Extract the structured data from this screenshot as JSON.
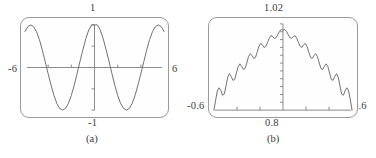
{
  "figure": {
    "background": "#ffffff",
    "frame_color": "#9a9a9a",
    "curve_color": "#6f6f6f",
    "axis_color": "#8a8a8a",
    "text_color": "#3a3a3a"
  },
  "panels": [
    {
      "id": "a",
      "caption": "(a)",
      "labels": {
        "top": "1",
        "left": "-6",
        "right": "6",
        "bottom": "-1"
      }
    },
    {
      "id": "b",
      "caption": "(b)",
      "labels": {
        "top": "1.02",
        "left": "-0.6",
        "right": "0.6",
        "bottom": "0.8"
      }
    }
  ],
  "chart_data": [
    {
      "type": "line",
      "title": "",
      "panel": "a",
      "xlabel": "",
      "ylabel": "",
      "xlim": [
        -6,
        6
      ],
      "ylim": [
        -1,
        1
      ],
      "xticks": [
        -6,
        -4,
        -2,
        0,
        2,
        4,
        6
      ],
      "yticks": [
        -1,
        -0.5,
        0,
        0.5,
        1
      ],
      "grid": false,
      "legend": "none",
      "series": [
        {
          "name": "cos(2x)",
          "expression": "y = cos(2x)",
          "x": [
            -6.0,
            -5.75,
            -5.5,
            -5.25,
            -5.0,
            -4.75,
            -4.5,
            -4.25,
            -4.0,
            -3.75,
            -3.5,
            -3.25,
            -3.0,
            -2.75,
            -2.5,
            -2.25,
            -2.0,
            -1.75,
            -1.5,
            -1.25,
            -1.0,
            -0.75,
            -0.5,
            -0.25,
            0.0,
            0.25,
            0.5,
            0.75,
            1.0,
            1.25,
            1.5,
            1.75,
            2.0,
            2.25,
            2.5,
            2.75,
            3.0,
            3.25,
            3.5,
            3.75,
            4.0,
            4.25,
            4.5,
            4.75,
            5.0,
            5.25,
            5.5,
            5.75,
            6.0
          ],
          "y": [
            0.8439,
            0.9602,
            0.9989,
            0.958,
            0.8391,
            0.6506,
            0.408,
            0.132,
            -0.1455,
            -0.412,
            -0.6536,
            -0.8415,
            -0.96,
            -0.9989,
            -0.9589,
            -0.8411,
            -0.6536,
            -0.4161,
            -0.1411,
            0.1455,
            0.4161,
            0.6755,
            0.8776,
            0.9988,
            1.0,
            0.9988,
            0.8776,
            0.6755,
            0.4161,
            0.1455,
            -0.1411,
            -0.4161,
            -0.6536,
            -0.8411,
            -0.9589,
            -0.9989,
            -0.96,
            -0.8415,
            -0.6536,
            -0.412,
            -0.1455,
            0.132,
            0.408,
            0.6506,
            0.8391,
            0.958,
            0.9989,
            0.9602,
            0.8439
          ]
        }
      ]
    },
    {
      "type": "line",
      "title": "",
      "panel": "b",
      "xlabel": "",
      "ylabel": "",
      "xlim": [
        -0.6,
        0.6
      ],
      "ylim": [
        0.8,
        1.02
      ],
      "xticks": [
        -0.6,
        -0.4,
        -0.2,
        0,
        0.2,
        0.4,
        0.6
      ],
      "yticks": [
        0.8,
        0.82,
        0.84,
        0.86,
        0.88,
        0.9,
        0.92,
        0.94,
        0.96,
        0.98,
        1.0,
        1.02
      ],
      "grid": false,
      "legend": "none",
      "series": [
        {
          "name": "partial-sum-ripples",
          "expression": "oscillating partial sum approaching 1 near x = 0",
          "x": [
            -0.6,
            -0.585,
            -0.57,
            -0.555,
            -0.54,
            -0.525,
            -0.51,
            -0.495,
            -0.48,
            -0.465,
            -0.45,
            -0.435,
            -0.42,
            -0.405,
            -0.39,
            -0.375,
            -0.36,
            -0.345,
            -0.33,
            -0.315,
            -0.3,
            -0.285,
            -0.27,
            -0.255,
            -0.24,
            -0.225,
            -0.21,
            -0.195,
            -0.18,
            -0.165,
            -0.15,
            -0.135,
            -0.12,
            -0.105,
            -0.09,
            -0.075,
            -0.06,
            -0.045,
            -0.03,
            -0.015,
            0.0,
            0.015,
            0.03,
            0.045,
            0.06,
            0.075,
            0.09,
            0.105,
            0.12,
            0.135,
            0.15,
            0.165,
            0.18,
            0.195,
            0.21,
            0.225,
            0.24,
            0.255,
            0.27,
            0.285,
            0.3,
            0.315,
            0.33,
            0.345,
            0.36,
            0.375,
            0.39,
            0.405,
            0.42,
            0.435,
            0.45,
            0.465,
            0.48,
            0.495,
            0.51,
            0.525,
            0.54,
            0.555,
            0.57,
            0.585,
            0.6
          ],
          "y": [
            0.8,
            0.826,
            0.849,
            0.857,
            0.85,
            0.838,
            0.841,
            0.862,
            0.884,
            0.893,
            0.886,
            0.876,
            0.878,
            0.894,
            0.911,
            0.918,
            0.912,
            0.904,
            0.906,
            0.92,
            0.936,
            0.944,
            0.94,
            0.932,
            0.934,
            0.947,
            0.962,
            0.97,
            0.967,
            0.96,
            0.962,
            0.972,
            0.983,
            0.99,
            0.988,
            0.983,
            0.985,
            0.993,
            1.001,
            1.006,
            1.004,
            1.006,
            1.001,
            0.993,
            0.985,
            0.983,
            0.988,
            0.99,
            0.983,
            0.972,
            0.962,
            0.96,
            0.967,
            0.97,
            0.962,
            0.947,
            0.934,
            0.932,
            0.94,
            0.944,
            0.936,
            0.92,
            0.906,
            0.904,
            0.912,
            0.918,
            0.911,
            0.894,
            0.878,
            0.876,
            0.886,
            0.893,
            0.884,
            0.862,
            0.841,
            0.838,
            0.85,
            0.857,
            0.849,
            0.826,
            0.8
          ]
        }
      ]
    }
  ]
}
